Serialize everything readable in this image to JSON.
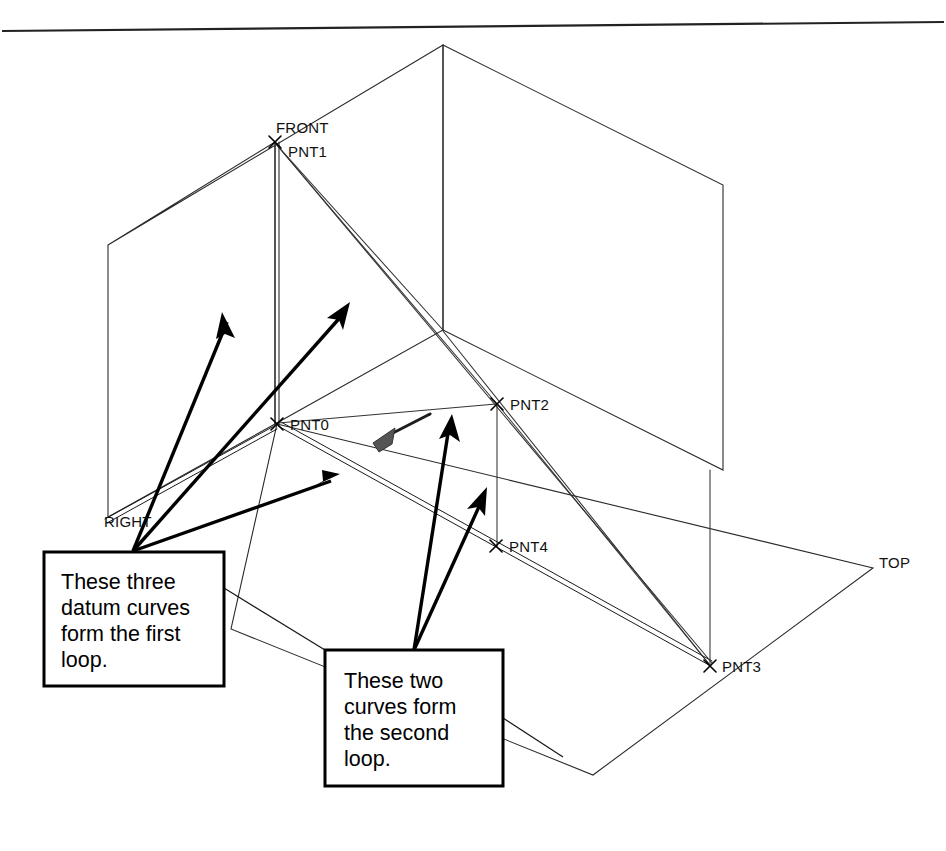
{
  "document": {
    "background_color": "#ffffff",
    "ink_color": "#000000",
    "top_rule": true
  },
  "datum_planes": [
    {
      "id": "front-plane",
      "label": "FRONT",
      "label_x": 276,
      "label_y": 133
    },
    {
      "id": "right-plane",
      "label": "RIGHT",
      "label_x": 104,
      "label_y": 527
    },
    {
      "id": "top-plane",
      "label": "TOP",
      "label_x": 879,
      "label_y": 568
    }
  ],
  "datum_points": [
    {
      "id": "pnt1",
      "label": "PNT1",
      "x": 275,
      "y": 142,
      "label_x": 288,
      "label_y": 157
    },
    {
      "id": "pnt0",
      "label": "PNT0",
      "x": 277,
      "y": 424,
      "label_x": 290,
      "label_y": 430
    },
    {
      "id": "pnt2",
      "label": "PNT2",
      "x": 497,
      "y": 404,
      "label_x": 510,
      "label_y": 410
    },
    {
      "id": "pnt4",
      "label": "PNT4",
      "x": 496,
      "y": 546,
      "label_x": 509,
      "label_y": 552
    },
    {
      "id": "pnt3",
      "label": "PNT3",
      "x": 710,
      "y": 666,
      "label_x": 722,
      "label_y": 672
    }
  ],
  "callouts": [
    {
      "id": "first-loop-callout",
      "lines": [
        "These three",
        "datum curves",
        "form the first",
        "loop."
      ],
      "box_x": 44,
      "box_y": 552,
      "box_w": 180,
      "box_h": 134,
      "arrow_origin_x": 133,
      "arrow_origin_y": 551,
      "arrow_targets": [
        {
          "x": 222,
          "y": 312
        },
        {
          "x": 350,
          "y": 302
        },
        {
          "x": 340,
          "y": 474
        }
      ]
    },
    {
      "id": "second-loop-callout",
      "lines": [
        "These two",
        "curves form",
        "the second",
        "loop."
      ],
      "box_x": 325,
      "box_y": 650,
      "box_w": 178,
      "box_h": 136,
      "arrow_origin_x": 414,
      "arrow_origin_y": 650,
      "arrow_targets": [
        {
          "x": 452,
          "y": 414
        },
        {
          "x": 487,
          "y": 487
        }
      ]
    }
  ],
  "cursor": {
    "name": "mouse-pointer",
    "tip_x": 373,
    "tip_y": 443,
    "tail_x": 430,
    "tail_y": 414
  },
  "geometry_notes": {
    "first_loop_curve_count": 3,
    "second_loop_curve_count": 2,
    "total_datum_points": 5,
    "total_datum_planes": 3
  }
}
